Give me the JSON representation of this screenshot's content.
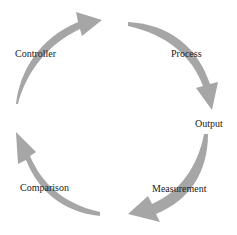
{
  "diagram": {
    "type": "cycle",
    "arrow_color": "#9a9a9a",
    "text_color": "#222222",
    "stages": [
      {
        "id": "controller",
        "label": "Controller"
      },
      {
        "id": "process",
        "label": "Process"
      },
      {
        "id": "output",
        "label": "Output"
      },
      {
        "id": "measurement",
        "label": "Measurement"
      },
      {
        "id": "comparison",
        "label": "Comparison"
      }
    ],
    "arrows": [
      {
        "from": "comparison",
        "to": "controller",
        "direction": "up-right"
      },
      {
        "from": "controller",
        "to": "process",
        "direction": "down-right"
      },
      {
        "from": "output",
        "to": "measurement",
        "direction": "down-left"
      },
      {
        "from": "measurement",
        "to": "comparison",
        "direction": "up-left"
      }
    ]
  }
}
